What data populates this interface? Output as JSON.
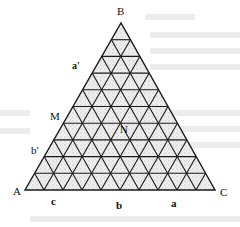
{
  "diagram": {
    "type": "ternary-triangular-grid",
    "subdivisions": 10,
    "vertices": {
      "A": {
        "label": "A",
        "x": 25,
        "y": 190
      },
      "B": {
        "label": "B",
        "x": 121,
        "y": 23
      },
      "C": {
        "label": "C",
        "x": 215,
        "y": 190
      }
    },
    "points": {
      "M": {
        "label": "M"
      },
      "N": {
        "label": "N"
      }
    },
    "side_labels": {
      "a_prime": "a'",
      "b_prime": "b'",
      "c": "c",
      "b": "b",
      "a": "a"
    },
    "colors": {
      "line": "#1a1a1a",
      "fill": "#e6e6e6",
      "stipple": "#777777",
      "background": "#ffffff",
      "ghost_text": "#e8e8e8"
    }
  }
}
